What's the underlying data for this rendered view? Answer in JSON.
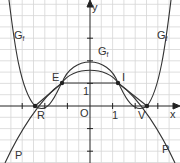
{
  "diagram": {
    "axes": {
      "x_label": "x",
      "y_label": "y",
      "origin_label": "O",
      "unit_x_label": "1",
      "unit_y_label": "1"
    },
    "curves": [
      {
        "name": "G_f outer",
        "label": "G",
        "subscript": "f"
      },
      {
        "name": "G_f inner peak",
        "label": "G",
        "subscript": "f"
      },
      {
        "name": "P",
        "label": "P"
      }
    ],
    "points": [
      {
        "label": "E"
      },
      {
        "label": "I"
      },
      {
        "label": "R"
      },
      {
        "label": "V"
      }
    ],
    "colors": {
      "grid": "#d6d6d6",
      "curve": "#333333",
      "axis": "#222222"
    }
  }
}
